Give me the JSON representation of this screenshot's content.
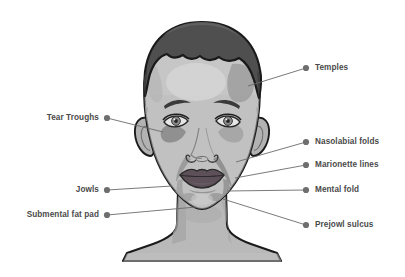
{
  "diagram": {
    "background_color": "#ffffff",
    "palette": {
      "skin_base": "#b9b9b9",
      "skin_light": "#d4d4d4",
      "skin_shadow": "#a3a3a3",
      "skin_deep_shadow": "#8f8f8f",
      "hair": "#4f4f4f",
      "hair_shadow": "#3d3d3d",
      "outline": "#1a1a1a",
      "lips": "#5e5058",
      "eye_iris": "#8a8a8a",
      "eye_white": "#e6e6e6",
      "leader_line": "#6b6b6b",
      "dot": "#6e6e6e",
      "text": "#4a4a4a"
    }
  },
  "labels": [
    {
      "id": "temples",
      "text": "Temples",
      "side": "right",
      "dot": {
        "x": 306,
        "y": 68
      },
      "text_pos": {
        "x": 315,
        "y": 64
      },
      "leader_end": {
        "x": 248,
        "y": 86
      }
    },
    {
      "id": "nasolabial-folds",
      "text": "Nasolabial folds",
      "side": "right",
      "dot": {
        "x": 306,
        "y": 142
      },
      "text_pos": {
        "x": 315,
        "y": 138
      },
      "leader_end": {
        "x": 236,
        "y": 162
      }
    },
    {
      "id": "marionette-lines",
      "text": "Marionette lines",
      "side": "right",
      "dot": {
        "x": 306,
        "y": 165
      },
      "text_pos": {
        "x": 315,
        "y": 161
      },
      "leader_end": {
        "x": 235,
        "y": 178
      }
    },
    {
      "id": "mental-fold",
      "text": "Mental fold",
      "side": "right",
      "dot": {
        "x": 306,
        "y": 190
      },
      "text_pos": {
        "x": 315,
        "y": 186
      },
      "leader_end": {
        "x": 227,
        "y": 191
      }
    },
    {
      "id": "prejowl-sulcus",
      "text": "Prejowl sulcus",
      "side": "right",
      "dot": {
        "x": 306,
        "y": 225
      },
      "text_pos": {
        "x": 315,
        "y": 221
      },
      "leader_end": {
        "x": 223,
        "y": 199
      }
    },
    {
      "id": "tear-troughs",
      "text": "Tear Troughs",
      "side": "left",
      "dot": {
        "x": 107,
        "y": 118
      },
      "text_pos": {
        "x": 99,
        "y": 114
      },
      "leader_end": {
        "x": 163,
        "y": 132
      }
    },
    {
      "id": "jowls",
      "text": "Jowls",
      "side": "left",
      "dot": {
        "x": 107,
        "y": 190
      },
      "text_pos": {
        "x": 99,
        "y": 186
      },
      "leader_end": {
        "x": 172,
        "y": 186
      }
    },
    {
      "id": "submental-fat-pad",
      "text": "Submental fat pad",
      "side": "left",
      "dot": {
        "x": 107,
        "y": 215
      },
      "text_pos": {
        "x": 99,
        "y": 211
      },
      "leader_end": {
        "x": 196,
        "y": 207
      }
    }
  ]
}
